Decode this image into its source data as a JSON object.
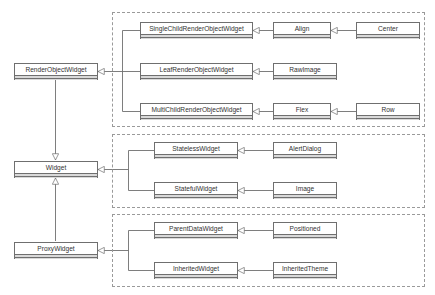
{
  "diagram": {
    "type": "uml-class-inheritance",
    "colors": {
      "line": "#6f6f6f",
      "group_border": "#9a9a9a",
      "box_fill": "#ffffff",
      "compartment_fill": "#d9d9d9",
      "text": "#333333"
    },
    "base": {
      "render_object_widget": "RenderObjectWidget",
      "widget": "Widget",
      "proxy_widget": "ProxyWidget"
    },
    "groups": [
      {
        "name": "render-object-group",
        "rows": [
          {
            "mid": "SingleChildRenderObjectWidget",
            "right": "Align",
            "far": "Center"
          },
          {
            "mid": "LeafRenderObjectWidget",
            "right": "RawImage"
          },
          {
            "mid": "MultiChildRenderObjectWidget",
            "right": "Flex",
            "far": "Row"
          }
        ]
      },
      {
        "name": "widget-group",
        "rows": [
          {
            "mid": "StatelessWidget",
            "right": "AlertDialog"
          },
          {
            "mid": "StatefulWidget",
            "right": "Image"
          }
        ]
      },
      {
        "name": "proxy-group",
        "rows": [
          {
            "mid": "ParentDataWidget",
            "right": "Positioned"
          },
          {
            "mid": "InheritedWidget",
            "right": "InheritedTheme"
          }
        ]
      }
    ],
    "relationships": [
      {
        "child": "RenderObjectWidget",
        "parent": "Widget"
      },
      {
        "child": "ProxyWidget",
        "parent": "Widget"
      },
      {
        "child": "SingleChildRenderObjectWidget",
        "parent": "RenderObjectWidget"
      },
      {
        "child": "LeafRenderObjectWidget",
        "parent": "RenderObjectWidget"
      },
      {
        "child": "MultiChildRenderObjectWidget",
        "parent": "RenderObjectWidget"
      },
      {
        "child": "Align",
        "parent": "SingleChildRenderObjectWidget"
      },
      {
        "child": "Center",
        "parent": "Align"
      },
      {
        "child": "RawImage",
        "parent": "LeafRenderObjectWidget"
      },
      {
        "child": "Flex",
        "parent": "MultiChildRenderObjectWidget"
      },
      {
        "child": "Row",
        "parent": "Flex"
      },
      {
        "child": "StatelessWidget",
        "parent": "Widget"
      },
      {
        "child": "StatefulWidget",
        "parent": "Widget"
      },
      {
        "child": "AlertDialog",
        "parent": "StatelessWidget"
      },
      {
        "child": "Image",
        "parent": "StatefulWidget"
      },
      {
        "child": "ParentDataWidget",
        "parent": "ProxyWidget"
      },
      {
        "child": "InheritedWidget",
        "parent": "ProxyWidget"
      },
      {
        "child": "Positioned",
        "parent": "ParentDataWidget"
      },
      {
        "child": "InheritedTheme",
        "parent": "InheritedWidget"
      }
    ]
  }
}
